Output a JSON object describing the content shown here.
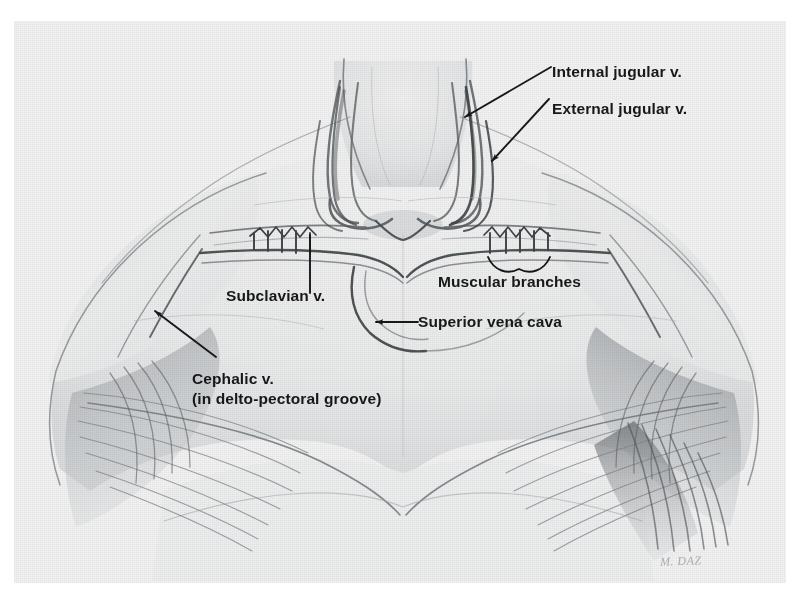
{
  "figure": {
    "kind": "anatomical-illustration",
    "medium": "pencil drawing, scanned halftone",
    "signature": "M. DAZ",
    "palette": {
      "page_background": "#ffffff",
      "plate_background": "#f2f2f2",
      "ink": "#16181a",
      "pencil_shadow": "#5a5f63",
      "pencil_mid": "#8c9196",
      "pencil_light": "#c3c7ca"
    }
  },
  "labels": [
    {
      "id": "internal-jugular",
      "text": "Internal jugular v.",
      "x": 552,
      "y": 50,
      "leader": "arrow-down-left"
    },
    {
      "id": "external-jugular",
      "text": "External jugular v.",
      "x": 552,
      "y": 87,
      "leader": "arrow-down-left"
    },
    {
      "id": "muscular-branches",
      "text": "Muscular branches",
      "x": 438,
      "y": 260,
      "leader": "brace-above"
    },
    {
      "id": "superior-vena-cava",
      "text": "Superior vena cava",
      "x": 418,
      "y": 313,
      "leader": "arrow-left"
    },
    {
      "id": "subclavian",
      "text": "Subclavian v.",
      "x": 226,
      "y": 275,
      "leader": "line-up"
    },
    {
      "id": "cephalic-line1",
      "text": "Cephalic v.",
      "x": 192,
      "y": 358,
      "leader": "arrow-up-left"
    },
    {
      "id": "cephalic-line2",
      "text": "(in delto-pectoral groove)",
      "x": 192,
      "y": 378,
      "leader": "none"
    }
  ],
  "structures": [
    "sternocleidomastoid-muscles",
    "internal-jugular-vein",
    "external-jugular-vein",
    "subclavian-vein",
    "superior-vena-cava",
    "muscular-branches",
    "cephalic-vein",
    "pectoralis-major",
    "deltoid",
    "clavicle"
  ]
}
